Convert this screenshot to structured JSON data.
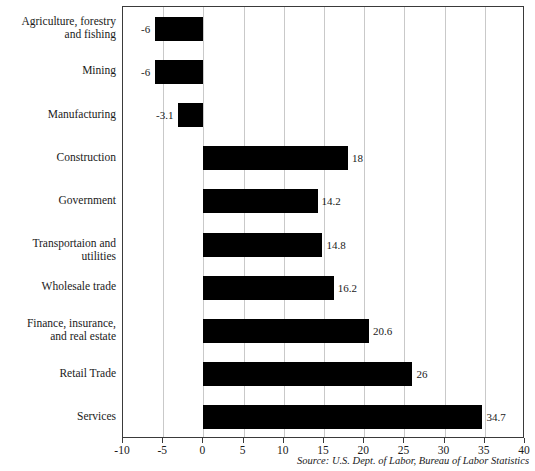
{
  "chart_data": {
    "type": "bar",
    "orientation": "horizontal",
    "title": "",
    "subtitle": "",
    "xlabel": "",
    "ylabel": "",
    "xlim": [
      -10,
      40
    ],
    "xticks": [
      -10,
      -5,
      0,
      5,
      10,
      15,
      20,
      25,
      30,
      35,
      40
    ],
    "xtick_labels": [
      "-10",
      "-5",
      "0",
      "5",
      "10",
      "15",
      "20",
      "25",
      "30",
      "35",
      "40"
    ],
    "grid": "vertical",
    "legend": null,
    "bar_color": "#000000",
    "gridline_color": "#c9c9c9",
    "frame_color": "#3a3a3a",
    "categories": [
      "Agriculture, forestry\nand fishing",
      "Mining",
      "Manufacturing",
      "Construction",
      "Government",
      "Transportaion and utilities",
      "Wholesale trade",
      "Finance, insurance,\nand real estate",
      "Retail Trade",
      "Services"
    ],
    "values": [
      -6,
      -6,
      -3.1,
      18,
      14.2,
      14.8,
      16.2,
      20.6,
      26,
      34.7
    ],
    "value_labels": [
      "-6",
      "-6",
      "-3.1",
      "18",
      "14.2",
      "14.8",
      "16.2",
      "20.6",
      "26",
      "34.7"
    ],
    "source_note": "Source: U.S. Dept. of Labor, Bureau of Labor Statistics"
  }
}
